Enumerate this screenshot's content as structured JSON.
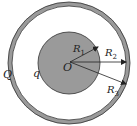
{
  "diagram": {
    "labels": {
      "outer_charge": "Q",
      "inner_charge": "q",
      "center": "O",
      "r1": {
        "main": "R",
        "sub": "1"
      },
      "r2": {
        "main": "R",
        "sub": "2"
      },
      "r3": {
        "main": "R",
        "sub": "3"
      }
    },
    "colors": {
      "inner_sphere_fill": "#9a9a9a",
      "shell_fill": "#9a9a9a",
      "outline": "#333333",
      "background": "#ffffff"
    },
    "geometry": {
      "center": [
        69,
        63
      ],
      "inner_radius": 31,
      "shell_inner_radius": 57,
      "shell_outer_radius": 61
    }
  }
}
